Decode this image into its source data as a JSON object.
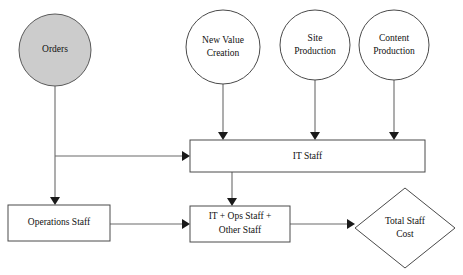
{
  "diagram": {
    "type": "flowchart",
    "background_color": "#ffffff",
    "shape_stroke_color": "#4a4a4a",
    "filled_shape_color": "#cccccc",
    "edge_color": "#6a6a6a",
    "arrowhead_color": "#1a1a1a",
    "nodes": {
      "orders": {
        "label": "Orders",
        "shape": "circle",
        "filled": true,
        "cx": 55,
        "cy": 50,
        "r": 36,
        "lines": [
          "Orders"
        ]
      },
      "new_value_creation": {
        "label": "New Value Creation",
        "shape": "circle",
        "filled": false,
        "cx": 223,
        "cy": 47,
        "r": 37,
        "lines": [
          "New Value",
          "Creation"
        ]
      },
      "site_production": {
        "label": "Site Production",
        "shape": "circle",
        "filled": false,
        "cx": 315,
        "cy": 45,
        "r": 35,
        "lines": [
          "Site",
          "Production"
        ]
      },
      "content_production": {
        "label": "Content Production",
        "shape": "circle",
        "filled": false,
        "cx": 394,
        "cy": 45,
        "r": 35,
        "lines": [
          "Content",
          "Production"
        ]
      },
      "it_staff": {
        "label": "IT Staff",
        "shape": "rectangle",
        "filled": false,
        "x": 190,
        "y": 140,
        "w": 235,
        "h": 32,
        "lines": [
          "IT Staff"
        ]
      },
      "operations_staff": {
        "label": "Operations Staff",
        "shape": "rectangle",
        "filled": false,
        "x": 8,
        "y": 205,
        "w": 102,
        "h": 36,
        "lines": [
          "Operations Staff"
        ]
      },
      "it_ops_other_staff": {
        "label": "IT + Ops Staff + Other Staff",
        "shape": "rectangle",
        "filled": false,
        "x": 190,
        "y": 206,
        "w": 100,
        "h": 36,
        "lines": [
          "IT + Ops Staff +",
          "Other Staff"
        ]
      },
      "total_staff_cost": {
        "label": "Total Staff Cost",
        "shape": "diamond",
        "filled": false,
        "cx": 405,
        "cy": 228,
        "rx": 50,
        "ry": 40,
        "lines": [
          "Total Staff",
          "Cost"
        ]
      }
    },
    "edges": [
      {
        "from": "orders",
        "to": "operations_staff",
        "name": "orders-to-operations-staff"
      },
      {
        "from": "orders",
        "to": "it_staff",
        "name": "orders-to-it-staff"
      },
      {
        "from": "new_value_creation",
        "to": "it_staff",
        "name": "new-value-creation-to-it-staff"
      },
      {
        "from": "site_production",
        "to": "it_staff",
        "name": "site-production-to-it-staff"
      },
      {
        "from": "content_production",
        "to": "it_staff",
        "name": "content-production-to-it-staff"
      },
      {
        "from": "it_staff",
        "to": "it_ops_other_staff",
        "name": "it-staff-to-it-ops-other-staff"
      },
      {
        "from": "operations_staff",
        "to": "it_ops_other_staff",
        "name": "operations-staff-to-it-ops-other-staff"
      },
      {
        "from": "it_ops_other_staff",
        "to": "total_staff_cost",
        "name": "it-ops-other-staff-to-total-staff-cost"
      }
    ]
  }
}
